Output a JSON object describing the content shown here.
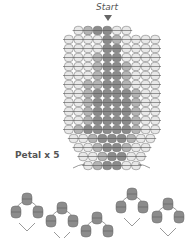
{
  "labels": {
    "start": "Start",
    "petal": "Petal x 5"
  },
  "colors": {
    "light": "#e8e8e8",
    "mid": "#b4b4b4",
    "dark": "#8c8c8c",
    "stroke": "#6a6a6a",
    "thread": "#555555"
  },
  "grid": {
    "bead_w": 9.6,
    "bead_h": 9.0,
    "origin_x": 64,
    "origin_y": 26,
    "rows": [
      {
        "offset": 1,
        "beads": [
          "L",
          "M",
          "D",
          "D",
          "L",
          "L"
        ]
      },
      {
        "offset": 0,
        "beads": [
          "L",
          "L",
          "L",
          "L",
          "D",
          "M",
          "L",
          "L",
          "L",
          "L"
        ]
      },
      {
        "offset": 0,
        "beads": [
          "L",
          "L",
          "L",
          "L",
          "D",
          "D",
          "L",
          "L",
          "L",
          "L"
        ]
      },
      {
        "offset": 0,
        "beads": [
          "L",
          "L",
          "L",
          "M",
          "D",
          "D",
          "L",
          "L",
          "L",
          "L"
        ]
      },
      {
        "offset": 0,
        "beads": [
          "L",
          "L",
          "L",
          "M",
          "D",
          "D",
          "M",
          "L",
          "L",
          "L"
        ]
      },
      {
        "offset": 0,
        "beads": [
          "L",
          "L",
          "L",
          "M",
          "D",
          "D",
          "M",
          "L",
          "L",
          "L"
        ]
      },
      {
        "offset": 0,
        "beads": [
          "L",
          "L",
          "M",
          "M",
          "D",
          "D",
          "M",
          "L",
          "L",
          "L"
        ]
      },
      {
        "offset": 0,
        "beads": [
          "L",
          "L",
          "M",
          "D",
          "D",
          "D",
          "D",
          "M",
          "L",
          "L"
        ]
      },
      {
        "offset": 0,
        "beads": [
          "L",
          "L",
          "M",
          "D",
          "D",
          "D",
          "D",
          "M",
          "L",
          "L"
        ]
      },
      {
        "offset": 0,
        "beads": [
          "L",
          "L",
          "M",
          "D",
          "D",
          "D",
          "D",
          "M",
          "L",
          "L"
        ]
      },
      {
        "offset": 0,
        "beads": [
          "L",
          "L",
          "M",
          "D",
          "D",
          "D",
          "D",
          "M",
          "L",
          "L"
        ]
      },
      {
        "offset": 0,
        "beads": [
          "L",
          "M",
          "D",
          "D",
          "D",
          "D",
          "D",
          "M",
          "L",
          "L"
        ]
      },
      {
        "offset": 0.5,
        "beads": [
          "L",
          "L",
          "M",
          "D",
          "D",
          "D",
          "M",
          "L",
          "L"
        ]
      },
      {
        "offset": 1,
        "beads": [
          "L",
          "L",
          "M",
          "D",
          "D",
          "M",
          "L",
          "L"
        ]
      },
      {
        "offset": 1.5,
        "beads": [
          "L",
          "L",
          "M",
          "D",
          "D",
          "L",
          "L"
        ]
      },
      {
        "offset": 2,
        "beads": [
          "L",
          "M",
          "D",
          "D",
          "L",
          "L"
        ]
      }
    ]
  },
  "motifs": [
    {
      "cx": 27,
      "cy": 213
    },
    {
      "cx": 62,
      "cy": 222
    },
    {
      "cx": 97,
      "cy": 232
    },
    {
      "cx": 132,
      "cy": 208
    },
    {
      "cx": 168,
      "cy": 218
    }
  ]
}
